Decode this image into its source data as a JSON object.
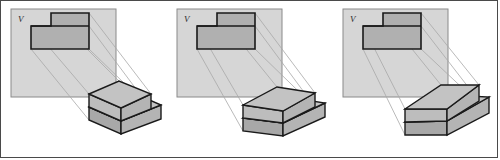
{
  "figure": {
    "type": "orthographic-projection-sequence",
    "panel_count": 3
  },
  "style": {
    "plane_fill": "#d6d6d6",
    "plane_stroke": "#8a8a8a",
    "projector_stroke": "#a8a8a8",
    "outline_stroke": "#1a1a1a",
    "face_top": "#c3c3c3",
    "face_front": "#b4b4b4",
    "face_side": "#a8a8a8",
    "face_chamfer": "#bdbdbd",
    "view_fill": "#b0b0b0",
    "frame_border": "#4a4a4a",
    "background": "#ffffff"
  },
  "panels": [
    {
      "id": "panel-1",
      "plane_label": "V",
      "rotation_stage": 1,
      "projected_view": {
        "name": "front-view",
        "outline": "30,48 30,25 50,25 50,12 88,12 88,48",
        "division_line": "30,25 88,25"
      },
      "plane_rect": {
        "x": 10,
        "y": 8,
        "w": 105,
        "h": 88
      },
      "solid": {
        "name": "stepped-block",
        "top_face": "88,93 118,80 150,93 120,107",
        "chamfer_face": "88,93 120,107 120,120 88,106",
        "front_face": "120,107 150,93 150,108 120,120",
        "base_top": "88,106 120,120 160,104 128,90",
        "base_front": "88,106 120,120 120,133 88,119",
        "base_side": "120,120 160,104 160,118 120,133"
      },
      "projectors": [
        "50,12 118,80",
        "88,12 150,93",
        "30,25 88,93",
        "30,48 88,119",
        "88,48 160,118",
        "88,25 150,108"
      ]
    },
    {
      "id": "panel-2",
      "plane_label": "V",
      "rotation_stage": 2,
      "projected_view": {
        "name": "front-view",
        "outline": "30,48 30,25 50,25 50,12 88,12 88,48",
        "division_line": "30,25 88,25"
      },
      "plane_rect": {
        "x": 10,
        "y": 8,
        "w": 105,
        "h": 88
      },
      "solid": {
        "name": "stepped-block",
        "top_face": "76,104 110,86 148,92 116,110",
        "chamfer_face": "76,104 116,110 116,122 76,117",
        "front_face": "116,110 148,92 148,106 116,122",
        "base_top": "76,117 116,122 158,102 120,96",
        "base_front": "76,117 116,122 116,135 76,130",
        "base_side": "116,122 158,102 158,116 116,135"
      },
      "projectors": [
        "50,12 110,86",
        "88,12 148,92",
        "30,25 76,104",
        "30,48 76,130",
        "88,48 158,116",
        "88,25 148,106"
      ]
    },
    {
      "id": "panel-3",
      "plane_label": "V",
      "rotation_stage": 3,
      "projected_view": {
        "name": "front-view",
        "outline": "30,48 30,25 50,25 50,12 88,12 88,48",
        "division_line": "30,25 88,25"
      },
      "plane_rect": {
        "x": 10,
        "y": 8,
        "w": 105,
        "h": 88
      },
      "solid": {
        "name": "stepped-block",
        "top_face": "72,108 108,84 146,84 114,108",
        "chamfer_face": "72,108 114,108 114,120 72,121",
        "front_face": "114,108 146,84 146,100 114,120",
        "base_top": "72,121 114,120 156,96 116,94",
        "base_front": "72,121 114,120 114,134 72,134",
        "base_side": "114,120 156,96 156,112 114,134"
      },
      "projectors": [
        "50,12 108,84",
        "88,12 146,84",
        "30,25 72,108",
        "30,48 72,134",
        "88,48 156,112",
        "88,25 146,100"
      ]
    }
  ]
}
